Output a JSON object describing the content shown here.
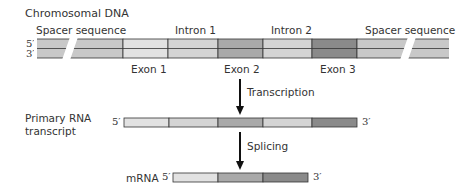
{
  "title": "Chromosomal DNA",
  "dna": {
    "left_top_end": "5′",
    "left_bottom_end": "3′",
    "right_top_end": "3′",
    "right_bottom_end": "5′",
    "labels_above": {
      "spacer_left": "Spacer sequence",
      "intron1": "Intron 1",
      "intron2": "Intron 2",
      "spacer_right": "Spacer sequence"
    },
    "labels_below": {
      "exon1": "Exon 1",
      "exon2": "Exon 2",
      "exon3": "Exon 3"
    },
    "segments": [
      "Spacer sequence",
      "Exon 1",
      "Intron 1",
      "Exon 2",
      "Intron 2",
      "Exon 3",
      "Spacer sequence"
    ]
  },
  "steps": {
    "transcription": "Transcription",
    "splicing": "Splicing"
  },
  "primary": {
    "label_line1": "Primary RNA",
    "label_line2": "transcript",
    "left_end": "5′",
    "right_end": "3′",
    "segments": [
      "Exon 1",
      "Intron 1",
      "Exon 2",
      "Intron 2",
      "Exon 3"
    ]
  },
  "mrna": {
    "label": "mRNA",
    "left_end": "5′",
    "right_end": "3′",
    "segments": [
      "Exon 1",
      "Exon 2",
      "Exon 3"
    ]
  },
  "colors": {
    "spacer": "#c8c8c8",
    "exon1": "#e2e2e2",
    "intron": "#d4d4d4",
    "exon2": "#a9a9a9",
    "exon3": "#8a8a8a",
    "outline": "#333333"
  }
}
